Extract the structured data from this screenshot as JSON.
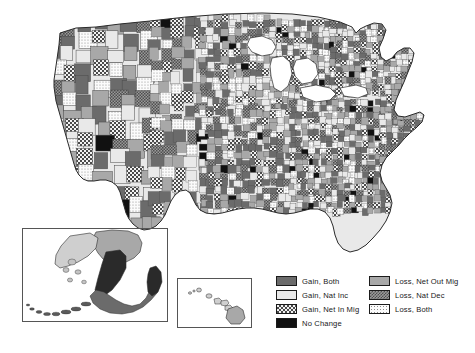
{
  "figure": {
    "type": "choropleth-map",
    "projection": "albers-usa",
    "insets": [
      "alaska",
      "hawaii"
    ],
    "background_color": "#ffffff",
    "outline_color": "#3a3a3a"
  },
  "legend": {
    "position": "bottom-right",
    "columns": 2,
    "left_column": [
      {
        "key": "gain-both",
        "label": "Gain, Both",
        "pattern": "solid",
        "color": "#6b6b6b"
      },
      {
        "key": "gain-nat-inc",
        "label": "Gain, Nat Inc",
        "pattern": "solid",
        "color": "#e9e9e9"
      },
      {
        "key": "gain-net-in-mig",
        "label": "Gain, Net In Mig",
        "pattern": "checkerboard",
        "color": "#4a4a4a"
      },
      {
        "key": "no-change",
        "label": "No Change",
        "pattern": "solid",
        "color": "#111111"
      }
    ],
    "right_column": [
      {
        "key": "loss-net-out-mig",
        "label": "Loss, Net Out Mig",
        "pattern": "solid",
        "color": "#a8a8a8"
      },
      {
        "key": "loss-nat-dec",
        "label": "Loss, Nat Dec",
        "pattern": "hatch",
        "color": "#4f4f4f"
      },
      {
        "key": "loss-both",
        "label": "Loss, Both",
        "pattern": "stipple",
        "color": "#8c8c8c"
      }
    ]
  },
  "chart_data": {
    "type": "map",
    "title": "",
    "categories": [
      "Gain, Both",
      "Gain, Nat Inc",
      "Gain, Net In Mig",
      "No Change",
      "Loss, Net Out Mig",
      "Loss, Nat Dec",
      "Loss, Both"
    ],
    "legend_position": "bottom-right",
    "regions": [
      "Contiguous United States",
      "Alaska",
      "Hawaii"
    ],
    "unit": "county"
  }
}
